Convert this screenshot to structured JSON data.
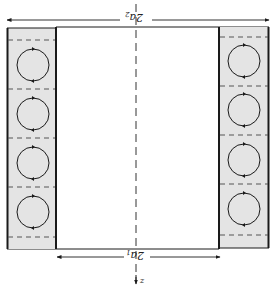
{
  "diagram": {
    "type": "cross-section",
    "colors": {
      "fill": "#e4e4e4",
      "stroke": "#1a1a1a",
      "dashed": "#555555"
    },
    "labels": {
      "outer_width": {
        "main": "2a",
        "sub": "2",
        "rotated": "180deg"
      },
      "inner_width": {
        "main": "2a",
        "sub": "1",
        "rotated": "180deg"
      },
      "axis": "z"
    },
    "left_column": {
      "cells": 4,
      "circulation": "clockwise"
    },
    "right_column": {
      "cells": 4,
      "circulation": "clockwise"
    }
  }
}
